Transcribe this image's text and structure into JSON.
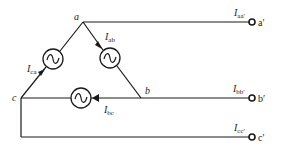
{
  "diagram": {
    "nodes": [
      {
        "id": "a",
        "label": "a"
      },
      {
        "id": "b",
        "label": "b"
      },
      {
        "id": "c",
        "label": "c"
      }
    ],
    "sources": [
      {
        "id": "ca",
        "current_label": "I",
        "current_sub": "ca"
      },
      {
        "id": "ab",
        "current_label": "I",
        "current_sub": "ab"
      },
      {
        "id": "bc",
        "current_label": "I",
        "current_sub": "bc"
      }
    ],
    "terminals": [
      {
        "id": "a_prime",
        "label": "a′",
        "current_label": "I",
        "current_sub": "aa′"
      },
      {
        "id": "b_prime",
        "label": "b′",
        "current_label": "I",
        "current_sub": "bb′"
      },
      {
        "id": "c_prime",
        "label": "c′",
        "current_label": "I",
        "current_sub": "cc′"
      }
    ],
    "source_symbol": "~"
  }
}
